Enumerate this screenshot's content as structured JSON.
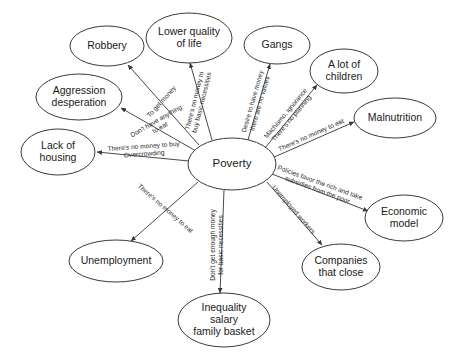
{
  "diagram": {
    "type": "concept-map",
    "center_node": {
      "id": "poverty",
      "label": "Poverty",
      "cx": 232,
      "cy": 164,
      "rx": 44,
      "ry": 26
    },
    "nodes": [
      {
        "id": "robbery",
        "lines": [
          "Robbery"
        ],
        "cx": 107,
        "cy": 46,
        "rx": 37,
        "ry": 20
      },
      {
        "id": "lower-quality-of-life",
        "lines": [
          "Lower quality",
          "of life"
        ],
        "cx": 189,
        "cy": 38,
        "rx": 43,
        "ry": 25
      },
      {
        "id": "gangs",
        "lines": [
          "Gangs"
        ],
        "cx": 277,
        "cy": 45,
        "rx": 33,
        "ry": 19
      },
      {
        "id": "a-lot-of-children",
        "lines": [
          "A lot of",
          "children"
        ],
        "cx": 344,
        "cy": 71,
        "rx": 34,
        "ry": 22
      },
      {
        "id": "malnutrition",
        "lines": [
          "Malnutrition"
        ],
        "cx": 395,
        "cy": 118,
        "rx": 41,
        "ry": 20
      },
      {
        "id": "aggression-desperation",
        "lines": [
          "Aggression",
          "desperation"
        ],
        "cx": 79,
        "cy": 97,
        "rx": 43,
        "ry": 23
      },
      {
        "id": "lack-of-housing",
        "lines": [
          "Lack of",
          "housing"
        ],
        "cx": 58,
        "cy": 152,
        "rx": 37,
        "ry": 23
      },
      {
        "id": "economic-model",
        "lines": [
          "Economic",
          "model"
        ],
        "cx": 404,
        "cy": 218,
        "rx": 39,
        "ry": 23
      },
      {
        "id": "unemployment",
        "lines": [
          "Unemployment"
        ],
        "cx": 116,
        "cy": 261,
        "rx": 47,
        "ry": 21
      },
      {
        "id": "companies-that-close",
        "lines": [
          "Companies",
          "that close"
        ],
        "cx": 341,
        "cy": 267,
        "rx": 39,
        "ry": 23
      },
      {
        "id": "inequality-salary-family-basket",
        "lines": [
          "Inequality",
          "salary",
          "family basket"
        ],
        "cx": 224,
        "cy": 320,
        "rx": 46,
        "ry": 27
      }
    ],
    "edges": [
      {
        "id": "edge-robbery",
        "from": "poverty",
        "to": "robbery",
        "x1": 199,
        "y1": 145,
        "x2": 128,
        "y2": 65,
        "label_lines": [
          "To get money"
        ],
        "label_x": 163,
        "label_y": 103,
        "label_rotate": -48
      },
      {
        "id": "edge-lower-quality-of-life",
        "from": "poverty",
        "to": "lower-quality-of-life",
        "x1": 212,
        "y1": 140,
        "x2": 190,
        "y2": 63,
        "label_lines": [
          "There's no money to",
          "buy basic necessities"
        ],
        "label_x": 200,
        "label_y": 102,
        "label_rotate": -76
      },
      {
        "id": "edge-gangs",
        "from": "poverty",
        "to": "gangs",
        "x1": 248,
        "y1": 140,
        "x2": 270,
        "y2": 64,
        "label_lines": [
          "Desire to have money",
          "there are no values"
        ],
        "label_x": 258,
        "label_y": 103,
        "label_rotate": -74
      },
      {
        "id": "edge-a-lot-of-children",
        "from": "poverty",
        "to": "a-lot-of-children",
        "x1": 265,
        "y1": 148,
        "x2": 317,
        "y2": 85,
        "label_lines": [
          "Machismo, ignorance",
          "There's no planning"
        ],
        "label_x": 290,
        "label_y": 117,
        "label_rotate": -50
      },
      {
        "id": "edge-malnutrition",
        "from": "poverty",
        "to": "malnutrition",
        "x1": 272,
        "y1": 158,
        "x2": 354,
        "y2": 122,
        "label_lines": [
          "There's no money to eat"
        ],
        "label_x": 312,
        "label_y": 137,
        "label_rotate": -24
      },
      {
        "id": "edge-aggression-desperation",
        "from": "poverty",
        "to": "aggression-desperation",
        "x1": 196,
        "y1": 151,
        "x2": 121,
        "y2": 108,
        "label_lines": [
          "Don't have anything",
          "to eat"
        ],
        "label_x": 159,
        "label_y": 126,
        "label_rotate": -30
      },
      {
        "id": "edge-lack-of-housing",
        "from": "poverty",
        "to": "lack-of-housing",
        "x1": 189,
        "y1": 161,
        "x2": 97,
        "y2": 152,
        "label_lines": [
          "There's no money to buy",
          "Overcrowding"
        ],
        "label_x": 144,
        "label_y": 152,
        "label_rotate": -4
      },
      {
        "id": "edge-unemployment",
        "from": "poverty",
        "to": "unemployment",
        "x1": 198,
        "y1": 182,
        "x2": 131,
        "y2": 241,
        "label_lines": [
          "There's no money to eat"
        ],
        "label_x": 164,
        "label_y": 210,
        "label_rotate": 41
      },
      {
        "id": "edge-inequality",
        "from": "poverty",
        "to": "inequality-salary-family-basket",
        "x1": 224,
        "y1": 190,
        "x2": 220,
        "y2": 293,
        "label_lines": [
          "Don't get enough money",
          "for basic necessities"
        ],
        "label_x": 219,
        "label_y": 245,
        "label_rotate": -90
      },
      {
        "id": "edge-economic-model",
        "from": "poverty",
        "to": "economic-model",
        "x1": 272,
        "y1": 174,
        "x2": 368,
        "y2": 211,
        "label_lines": [
          "Policies favor the rich and take",
          "subsidies from the poor"
        ],
        "label_x": 318,
        "label_y": 188,
        "label_rotate": 20
      },
      {
        "id": "edge-companies-that-close",
        "from": "poverty",
        "to": "companies-that-close",
        "x1": 267,
        "y1": 182,
        "x2": 322,
        "y2": 245,
        "label_lines": [
          "Unemployed workers"
        ],
        "label_x": 292,
        "label_y": 211,
        "label_rotate": 49
      }
    ]
  }
}
